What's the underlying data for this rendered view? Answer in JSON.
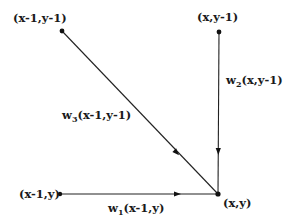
{
  "diagram": {
    "type": "directed-graph",
    "nodes": [
      {
        "id": "top_left",
        "label": "(x-1,y-1)",
        "x": 62,
        "y": 31
      },
      {
        "id": "top_right",
        "label": "(x,y-1)",
        "x": 219,
        "y": 32
      },
      {
        "id": "bottom_left",
        "label": "(x-1,y)",
        "x": 60,
        "y": 194
      },
      {
        "id": "bottom_right",
        "label": "(x,y)",
        "x": 218,
        "y": 194
      }
    ],
    "edges": [
      {
        "from": "top_left",
        "to": "bottom_right",
        "weight_symbol": "w",
        "weight_index": "3",
        "weight_arg": "(x-1,y-1)"
      },
      {
        "from": "top_right",
        "to": "bottom_right",
        "weight_symbol": "w",
        "weight_index": "2",
        "weight_arg": "(x,y-1)"
      },
      {
        "from": "bottom_left",
        "to": "bottom_right",
        "weight_symbol": "w",
        "weight_index": "1",
        "weight_arg": "(x-1,y)"
      }
    ],
    "colors": {
      "line": "#222222",
      "text": "#1a1a1a",
      "background": "#ffffff"
    }
  }
}
